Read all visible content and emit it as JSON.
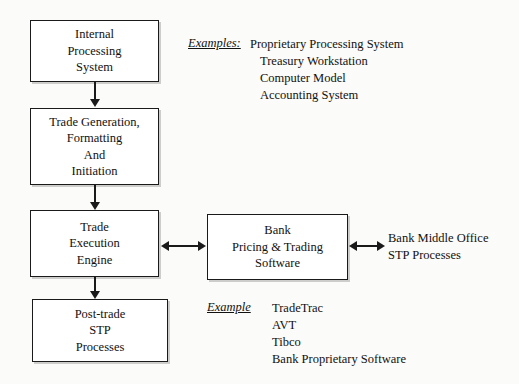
{
  "diagram": {
    "boxes": {
      "internal_processing": {
        "lines": [
          "Internal",
          "Processing",
          "System"
        ]
      },
      "trade_generation": {
        "lines": [
          "Trade Generation,",
          "Formatting",
          "And",
          "Initiation"
        ]
      },
      "trade_execution": {
        "lines": [
          "Trade",
          "Execution",
          "Engine"
        ]
      },
      "post_trade": {
        "lines": [
          "Post-trade",
          "STP",
          "Processes"
        ]
      },
      "bank_pricing": {
        "lines": [
          "Bank",
          "Pricing & Trading",
          "Software"
        ]
      }
    },
    "annotations": {
      "examples_top": {
        "label": "Examples:",
        "items": [
          "Proprietary Processing System",
          "Treasury Workstation",
          "Computer Model",
          "Accounting System"
        ]
      },
      "example_bottom": {
        "label": "Example",
        "items": [
          "TradeTrac",
          "AVT",
          "Tibco",
          "Bank Proprietary Software"
        ]
      },
      "side_note": {
        "lines": [
          "Bank Middle Office",
          "STP Processes"
        ]
      }
    },
    "colors": {
      "background": "#fbfbf9",
      "box_fill": "#ffffff",
      "stroke": "#1a1a1a",
      "text": "#111111"
    }
  }
}
